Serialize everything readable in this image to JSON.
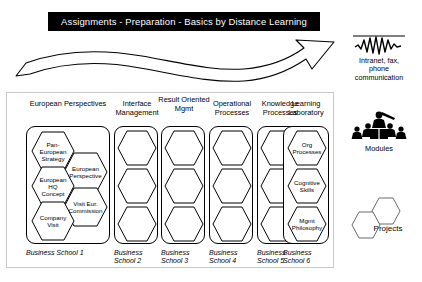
{
  "banner": {
    "title": "Assignments - Preparation - Basics by Distance Learning"
  },
  "flow_arrow": {
    "icon": "curved-right-arrow"
  },
  "columns": [
    {
      "id": "european-perspectives",
      "header": "European\nPerspectives",
      "footer": "Business\nSchool 1",
      "nodes": [
        {
          "label": "Pan-\nEuropean\nStrategy"
        },
        {
          "label": "European\nPerspective"
        },
        {
          "label": "European\nHQ\nConcept"
        },
        {
          "label": "Visit Eur.\nCommission"
        },
        {
          "label": "Company\nVisit"
        }
      ]
    },
    {
      "id": "interface-management",
      "header": "Interface\nManagement",
      "footer": "Business\nSchool 2",
      "nodes": [
        {
          "label": ""
        },
        {
          "label": ""
        },
        {
          "label": ""
        }
      ]
    },
    {
      "id": "result-oriented-mgmt",
      "header": "Result\nOriented\nMgmt",
      "footer": "Business\nSchool 3",
      "nodes": [
        {
          "label": ""
        },
        {
          "label": ""
        },
        {
          "label": ""
        }
      ]
    },
    {
      "id": "operational-processes",
      "header": "Operational\nProcesses",
      "footer": "Business\nSchool 4",
      "nodes": [
        {
          "label": ""
        },
        {
          "label": ""
        },
        {
          "label": ""
        }
      ]
    },
    {
      "id": "knowledge-processes",
      "header": "Knowledge\nProcesses",
      "footer": "Business\nSchool 5",
      "nodes": [
        {
          "label": ""
        },
        {
          "label": ""
        },
        {
          "label": ""
        }
      ]
    },
    {
      "id": "learning-laboratory",
      "header": "Learning\nLaboratory",
      "footer": "Business\nSchool 6",
      "nodes": [
        {
          "label": "Org\nProcesses"
        },
        {
          "label": "Cognitive\nSkills"
        },
        {
          "label": "Mgmt\nPhilosophy"
        }
      ]
    }
  ],
  "side_panel": {
    "communication": {
      "icon": "waveform-icon",
      "caption": "Intranet, fax,\nphone\ncommunication"
    },
    "modules": {
      "icon": "audience-presenter-icon",
      "caption": "Modules"
    },
    "projects": {
      "icon": "двух-hexagons-icon",
      "caption": "Projects"
    }
  },
  "colors": {
    "banner_bg": "#000000",
    "banner_text": "#ffffff",
    "stroke": "#000000",
    "frame": "#c9c9c9"
  }
}
